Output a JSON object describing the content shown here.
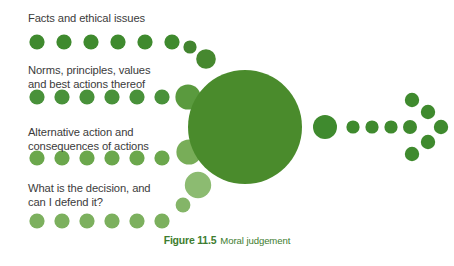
{
  "figure": {
    "caption_number": "Figure 11.5",
    "caption_title": "Moral judgement",
    "background_color": "#ffffff",
    "text_color": "#3b3b3b",
    "caption_color": "#3e7d2f"
  },
  "palette": {
    "dark_green": "#3f8a2e",
    "core_green": "#4a8b2c",
    "mid_green": "#5f9b3d",
    "light_green": "#7cb05e",
    "pale_green": "#9dc57f"
  },
  "stages": [
    {
      "id": "facts",
      "label": "Facts and ethical issues",
      "dot_color": "#3f8a2e",
      "dot_count": 6
    },
    {
      "id": "norms",
      "label": "Norms, principles, values\nand best actions thereof",
      "dot_color": "#49913a",
      "dot_count": 7
    },
    {
      "id": "alternative",
      "label": "Alternative action and\nconsequences of actions",
      "dot_color": "#6ba74c",
      "dot_count": 7
    },
    {
      "id": "decision",
      "label": "What is the decision, and\ncan I defend it?",
      "dot_color": "#7cb05e",
      "dot_count": 7
    }
  ],
  "hub": {
    "name": "moral-judgement-core",
    "center_x": 245,
    "center_y": 127,
    "radius": 57,
    "color": "#4a8b2c"
  },
  "output_arrow": {
    "name": "outcome-arrow",
    "color": "#3f8a2e",
    "shaft_dots": [
      {
        "cx": 325,
        "cy": 127,
        "r": 12
      },
      {
        "cx": 353,
        "cy": 127,
        "r": 6.5
      },
      {
        "cx": 372,
        "cy": 127,
        "r": 6.5
      },
      {
        "cx": 391,
        "cy": 127,
        "r": 6.5
      },
      {
        "cx": 410,
        "cy": 127,
        "r": 6.5
      }
    ],
    "head_dots": [
      {
        "cx": 412,
        "cy": 100,
        "r": 7
      },
      {
        "cx": 429,
        "cy": 112,
        "r": 7
      },
      {
        "cx": 430,
        "cy": 127,
        "r": 7
      },
      {
        "cx": 428,
        "cy": 141,
        "r": 7
      },
      {
        "cx": 412,
        "cy": 153,
        "r": 7
      },
      {
        "cx": 413,
        "cy": 127,
        "r": 7
      }
    ]
  }
}
